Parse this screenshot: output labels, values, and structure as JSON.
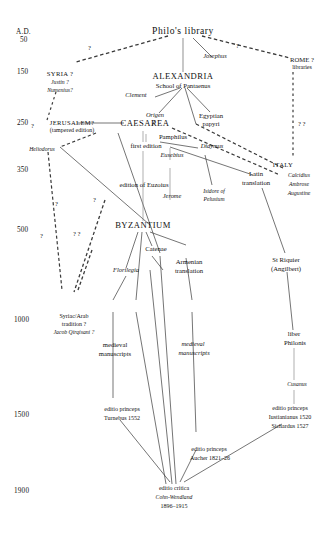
{
  "diagram": {
    "type": "stemma"
  },
  "axis": {
    "label": "A.D.",
    "ticks": [
      "50",
      "150",
      "250",
      "350",
      "500",
      "1000",
      "1500",
      "1900"
    ]
  },
  "nodes": {
    "philo_library": "Philo's library",
    "josephus": "Josephus",
    "rome": "ROME ?",
    "rome_sub": "libraries",
    "syria": "SYRIA ?",
    "justin": "Justin ?",
    "numenius": "Numenius?",
    "alexandria": "ALEXANDRIA",
    "alexandria_sub": "School of Pantaenus",
    "clement": "Clement",
    "origen": "Origen",
    "egyptian": "Egyptian",
    "papyri": "papyri",
    "jerusalem": "JERUSALEM?",
    "jerusalem_sub": "(tampered edition)",
    "caesarea": "CAESAREA",
    "pamphilus": "Pamphilus",
    "first_edition": "first edition",
    "eusebius": "Eusebius",
    "didymus": "Didymus",
    "heliodorus": "Heliodorus",
    "euzoius": "edition of Euzoius",
    "jerome": "Jerome",
    "isidore1": "Isidore of",
    "isidore2": "Pelusium",
    "italy": "ITALY",
    "calcidius": "Calcidius",
    "ambrose": "Ambrose",
    "augustine": "Augustine",
    "latin1": "Latin",
    "latin2": "translation",
    "byzantium": "BYZANTIUM",
    "catenae": "Catenae",
    "armenian1": "Armenian",
    "armenian2": "translation",
    "florilegia": "Florilegia",
    "st_riquier1": "St Riquier",
    "st_riquier2": "(Angilbert)",
    "syriac_arab1": "Syriac/Arab",
    "syriac_arab2": "tradition ?",
    "jacob_qirqisani": "Jacob Qirqisani ?",
    "medieval_left1": "medieval",
    "medieval_left2": "manuscripts",
    "medieval_right1": "medieval",
    "medieval_right2": "manuscripts",
    "liber1": "liber",
    "liber2": "Philonis",
    "cusanus": "Cusanus",
    "ed_turnebus1": "editio princeps",
    "ed_turnebus2": "Turnebus 1552",
    "ed_aucher1": "editio princeps",
    "ed_aucher2": "Aucher 1821–26",
    "ed_italy1": "editio princeps",
    "ed_italy2": "Iustianianus 1520",
    "ed_italy3": "Sichardus 1527",
    "ed_critica1": "editio critica",
    "ed_critica2": "Cohn-Wendland",
    "ed_critica3": "1896–1915"
  },
  "marks": {
    "q1": "?",
    "q2": "?",
    "q3": "?",
    "q4": "?",
    "q5": "?",
    "q6": "?",
    "q7": "? ?",
    "q8": "? ?"
  },
  "colors": {
    "ink": "#111111",
    "background": "#ffffff",
    "line": "#333333"
  }
}
